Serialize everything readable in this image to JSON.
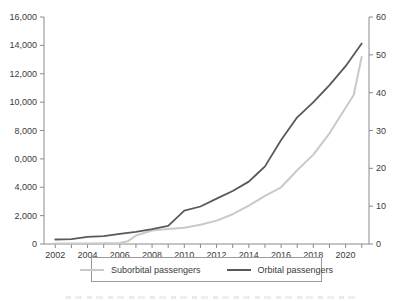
{
  "page": {
    "background": "#ffffff",
    "axis_color": "#8a8a8a",
    "text_color": "#3a3a3a"
  },
  "chart_data": {
    "type": "line",
    "title": "",
    "xlabel": "",
    "ylabel_left": "",
    "ylabel_right": "",
    "grid": false,
    "axis_color": "#8a8a8a",
    "xlim": [
      2001.3,
      2021.45
    ],
    "ylim_left": [
      0,
      16000
    ],
    "ylim_right": [
      0,
      60
    ],
    "left_ticks": [
      {
        "value": 0,
        "label": "0"
      },
      {
        "value": 2000,
        "label": "2,000"
      },
      {
        "value": 4000,
        "label": "4,000"
      },
      {
        "value": 6000,
        "label": "0,000"
      },
      {
        "value": 8000,
        "label": "8,000"
      },
      {
        "value": 10000,
        "label": "10,000"
      },
      {
        "value": 12000,
        "label": "12,000"
      },
      {
        "value": 14000,
        "label": "14,000"
      },
      {
        "value": 16000,
        "label": "16,000"
      }
    ],
    "right_ticks": [
      0,
      10,
      20,
      30,
      40,
      50,
      60
    ],
    "x_minor_ticks": [
      2002,
      2003,
      2004,
      2005,
      2006,
      2007,
      2008,
      2009,
      2010,
      2011,
      2012,
      2013,
      2014,
      2015,
      2016,
      2017,
      2018,
      2019,
      2020,
      2021
    ],
    "x_label_ticks": [
      2002,
      2004,
      2006,
      2008,
      2010,
      2012,
      2014,
      2016,
      2018,
      2020
    ],
    "series": [
      {
        "name": "Suborbital passengers",
        "axis": "left",
        "color": "#c9c9c9",
        "width": 2,
        "x": [
          2002,
          2003,
          2004,
          2005,
          2006,
          2006.5,
          2007,
          2008,
          2009,
          2010,
          2011,
          2012,
          2013,
          2014,
          2015,
          2016,
          2017,
          2018,
          2019,
          2020,
          2020.5,
          2021
        ],
        "values": [
          30,
          30,
          40,
          50,
          80,
          200,
          600,
          950,
          1050,
          1150,
          1350,
          1650,
          2100,
          2700,
          3400,
          4000,
          5200,
          6300,
          7800,
          9600,
          10500,
          13200
        ]
      },
      {
        "name": "Orbital passengers",
        "axis": "right",
        "color": "#595959",
        "width": 1.8,
        "x": [
          2002,
          2003,
          2004,
          2005,
          2006,
          2007,
          2008,
          2009,
          2010,
          2011,
          2012,
          2013,
          2014,
          2014.5,
          2015,
          2016,
          2017,
          2018,
          2019,
          2020,
          2021
        ],
        "values": [
          1.2,
          1.3,
          1.9,
          2.1,
          2.7,
          3.2,
          3.9,
          4.8,
          8.8,
          9.9,
          12,
          14,
          16.5,
          18.5,
          20.5,
          27.5,
          33.5,
          37.5,
          42,
          47,
          53
        ]
      }
    ],
    "legend": {
      "position": "bottom-center",
      "border_color": "#9a9a9a",
      "items": [
        {
          "label": "Suborbital passengers",
          "color": "#c9c9c9"
        },
        {
          "label": "Orbital passengers",
          "color": "#595959"
        }
      ]
    }
  }
}
